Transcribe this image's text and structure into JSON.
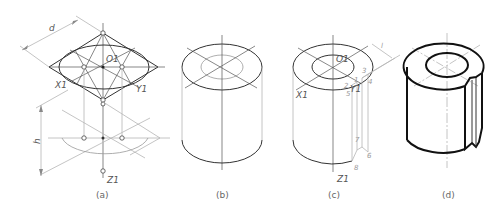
{
  "figure": {
    "panels": [
      {
        "id": "a",
        "caption": "(a)",
        "labels": {
          "dimension_width": "d",
          "dimension_height": "h",
          "top_center": "O1",
          "axis_x": "X1",
          "axis_y": "Y1",
          "axis_z": "Z1"
        }
      },
      {
        "id": "b",
        "caption": "(b)"
      },
      {
        "id": "c",
        "caption": "(c)",
        "labels": {
          "top_center": "O1",
          "axis_x": "X1",
          "axis_y": "Y1",
          "axis_z": "Z1",
          "slot_width": "l",
          "points": [
            "1",
            "2",
            "3",
            "4",
            "5",
            "6",
            "7",
            "8"
          ]
        }
      },
      {
        "id": "d",
        "caption": "(d)"
      }
    ]
  }
}
